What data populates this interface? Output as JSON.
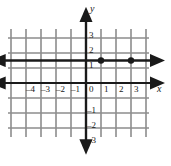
{
  "figure": {
    "kind": "coordinate-plane",
    "background": "#ffffff",
    "grid_color": "#8c8c8c",
    "axis_color": "#1a1a1a",
    "line_color": "#1a1a1a",
    "point_color": "#1a1a1a"
  },
  "axes": {
    "x_axis_label": "x",
    "y_axis_label": "y",
    "origin_label": "0",
    "x_ticks": [
      "–4",
      "–3",
      "–2",
      "–1",
      "1",
      "2",
      "3"
    ],
    "y_ticks": [
      "3",
      "2",
      "1",
      "–1",
      "–2",
      "–3"
    ]
  },
  "chart_data": {
    "type": "line",
    "title": "",
    "xlabel": "x",
    "ylabel": "y",
    "xlim": [
      -5,
      4
    ],
    "ylim": [
      -4,
      4
    ],
    "grid": true,
    "legend": "none",
    "series": [
      {
        "name": "horizontal line",
        "equation": "y = 1.5",
        "x": [
          -5,
          4
        ],
        "y": [
          1.5,
          1.5
        ],
        "arrows": "both",
        "points": [
          {
            "x": 1,
            "y": 1.5
          },
          {
            "x": 3,
            "y": 1.5
          }
        ]
      }
    ],
    "x_tick_values": [
      -4,
      -3,
      -2,
      -1,
      0,
      1,
      2,
      3
    ],
    "y_tick_values": [
      3,
      2,
      1,
      0,
      -1,
      -2,
      -3
    ]
  }
}
